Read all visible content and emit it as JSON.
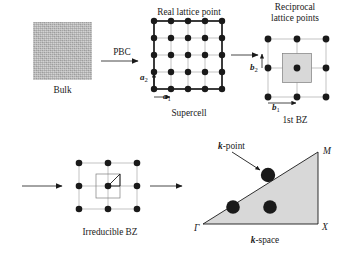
{
  "figure": {
    "type": "diagram"
  },
  "panels": {
    "bulk": {
      "caption": "Bulk",
      "fill_color": "#b6b6b6"
    },
    "supercell": {
      "title": "Real lattice point",
      "caption": "Supercell",
      "grid_rows": 5,
      "grid_cols": 5,
      "vector_a1": "a",
      "vector_a1_sub": "1",
      "vector_a2": "a",
      "vector_a2_sub": "2",
      "point_color": "#1a1a1a"
    },
    "reciprocal": {
      "title_line1": "Reciprocal",
      "title_line2": "lattice points",
      "caption": "1st BZ",
      "grid_rows": 3,
      "grid_cols": 3,
      "vector_b1": "b",
      "vector_b1_sub": "1",
      "vector_b2": "b",
      "vector_b2_sub": "2",
      "bz_fill_color": "#d8d8d8",
      "point_color": "#1a1a1a"
    },
    "irreducible": {
      "caption": "Irreducible BZ",
      "grid_rows": 3,
      "grid_cols": 3,
      "point_color": "#1a1a1a"
    },
    "kspace": {
      "caption": "k-space",
      "caption_bold_prefix": "k",
      "caption_rest": "-space",
      "annotation": "k-point",
      "annotation_bold_prefix": "k",
      "annotation_rest": "-point",
      "vertex_gamma": "Γ",
      "vertex_x": "X",
      "vertex_m": "M",
      "triangle_fill_color": "#d8d8d8",
      "kpoint_count": 3,
      "kpoint_color": "#1a1a1a"
    }
  },
  "arrows": {
    "pbc_label": "PBC",
    "supercell_to_reciprocal": "arrow-right",
    "wrap_to_irreducible": "arrow-right",
    "irreducible_to_kspace": "arrow-right"
  },
  "colors": {
    "ink": "#1a1a1a",
    "grid_line": "#8a8a8a",
    "bulk_gray": "#b6b6b6",
    "zone_gray": "#d8d8d8"
  }
}
